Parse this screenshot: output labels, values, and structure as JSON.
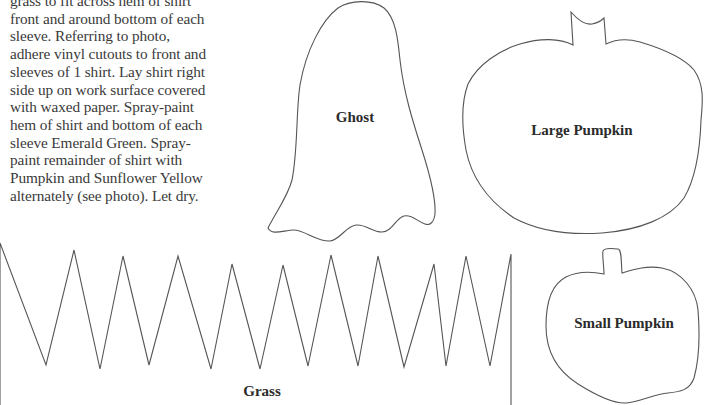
{
  "instructions": {
    "lines": [
      "grass to fit across hem of shirt",
      "front and around bottom of each",
      "sleeve. Referring to photo,",
      "adhere vinyl cutouts to front and",
      "sleeves of 1 shirt. Lay shirt right",
      "side up on work surface covered",
      "with waxed paper. Spray-paint",
      "hem of shirt and bottom of each",
      "sleeve Emerald Green. Spray-",
      "paint remainder of shirt with",
      "Pumpkin and Sunflower Yellow",
      "alternately (see photo). Let dry."
    ]
  },
  "patterns": {
    "ghost": {
      "label": "Ghost"
    },
    "large_pumpkin": {
      "label": "Large Pumpkin"
    },
    "small_pumpkin": {
      "label": "Small Pumpkin"
    },
    "grass": {
      "label": "Grass"
    }
  },
  "colors": {
    "outline": "#555555",
    "text": "#2b2b2b",
    "background": "#ffffff"
  }
}
